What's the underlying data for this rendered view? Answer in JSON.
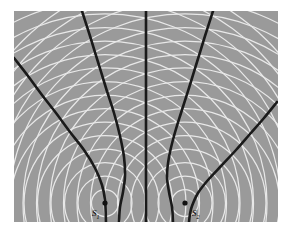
{
  "figure": {
    "name": "two-source-interference-pattern",
    "background_color": "#ffffff",
    "field_color": "#9a9a9a",
    "wavefront_color": "#e8e8e8",
    "nodal_line_color": "#1a1a1a",
    "source_dot_color": "#111111",
    "field": {
      "x": 14,
      "y": 11,
      "width": 264,
      "height": 211
    }
  },
  "sources": [
    {
      "id": "S1",
      "label": "S",
      "subscript": "1",
      "cx": 105,
      "cy": 203,
      "radius": 2.6,
      "label_x": 92,
      "label_y": 216
    },
    {
      "id": "S2",
      "label": "S",
      "subscript": "2",
      "cx": 185,
      "cy": 203,
      "radius": 2.6,
      "label_x": 192,
      "label_y": 216
    }
  ],
  "chart_data": {
    "type": "line",
    "title": "",
    "xlabel": "",
    "ylabel": "",
    "wavelength": 13.5,
    "source_separation": 80,
    "wavefront_ring_count": 17,
    "nodal_line_count": 5,
    "nodal_line_orders": [
      -2,
      -1,
      0,
      1,
      2
    ],
    "nodal_lines": [
      {
        "order": -2,
        "label": "outer-left-nodal-line",
        "points": [
          [
            14,
            58
          ],
          [
            28,
            76
          ],
          [
            42,
            95
          ],
          [
            56,
            113
          ],
          [
            70,
            132
          ],
          [
            84,
            150
          ],
          [
            95,
            168
          ],
          [
            102,
            185
          ],
          [
            105,
            200
          ],
          [
            106,
            222
          ]
        ]
      },
      {
        "order": -1,
        "label": "inner-left-nodal-line",
        "points": [
          [
            82,
            11
          ],
          [
            90,
            36
          ],
          [
            98,
            62
          ],
          [
            106,
            88
          ],
          [
            114,
            113
          ],
          [
            120,
            136
          ],
          [
            124,
            157
          ],
          [
            125,
            176
          ],
          [
            123,
            192
          ],
          [
            120,
            207
          ],
          [
            119,
            222
          ]
        ]
      },
      {
        "order": 0,
        "label": "central-nodal-line",
        "points": [
          [
            146,
            11
          ],
          [
            146,
            45
          ],
          [
            146,
            80
          ],
          [
            146,
            115
          ],
          [
            146,
            150
          ],
          [
            146,
            185
          ],
          [
            146,
            222
          ]
        ]
      },
      {
        "order": 1,
        "label": "inner-right-nodal-line",
        "points": [
          [
            213,
            11
          ],
          [
            205,
            36
          ],
          [
            197,
            62
          ],
          [
            189,
            88
          ],
          [
            181,
            113
          ],
          [
            174,
            136
          ],
          [
            169,
            157
          ],
          [
            167,
            176
          ],
          [
            169,
            192
          ],
          [
            172,
            207
          ],
          [
            173,
            222
          ]
        ]
      },
      {
        "order": 2,
        "label": "outer-right-nodal-line",
        "points": [
          [
            277,
            102
          ],
          [
            264,
            118
          ],
          [
            250,
            134
          ],
          [
            236,
            150
          ],
          [
            222,
            165
          ],
          [
            208,
            180
          ],
          [
            198,
            193
          ],
          [
            192,
            206
          ],
          [
            190,
            214
          ],
          [
            189,
            222
          ]
        ]
      }
    ]
  }
}
